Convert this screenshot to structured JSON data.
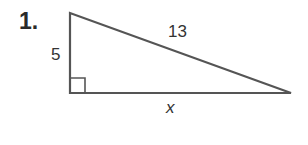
{
  "problem": {
    "number": "1.",
    "figure": "right-triangle",
    "sides": {
      "leg_vertical": "5",
      "hypotenuse": "13",
      "leg_horizontal": "x"
    },
    "right_angle_marker": true,
    "stroke_color": "#555555"
  }
}
